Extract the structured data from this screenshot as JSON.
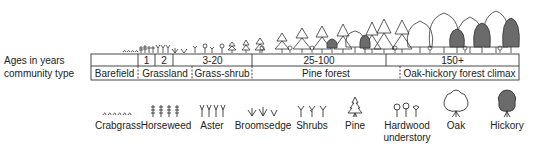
{
  "diagram": {
    "row_labels": {
      "ages": "Ages in years",
      "community": "community type"
    },
    "ages": [
      {
        "label": "",
        "x0": 91,
        "x1": 138
      },
      {
        "label": "1",
        "x0": 138,
        "x1": 155
      },
      {
        "label": "2",
        "x0": 155,
        "x1": 173
      },
      {
        "label": "3-20",
        "x0": 173,
        "x1": 252
      },
      {
        "label": "25-100",
        "x0": 252,
        "x1": 386
      },
      {
        "label": "150+",
        "x0": 386,
        "x1": 519
      }
    ],
    "communities": [
      {
        "label": "Barefield",
        "x0": 91,
        "x1": 138
      },
      {
        "label": "Grassland",
        "x0": 138,
        "x1": 192
      },
      {
        "label": "Grass-shrub",
        "x0": 192,
        "x1": 252
      },
      {
        "label": "Pine forest",
        "x0": 252,
        "x1": 400
      },
      {
        "label": "Oak-hickory forest climax",
        "x0": 400,
        "x1": 519
      }
    ],
    "colors": {
      "line": "#333333",
      "hickory_fill": "#6b6b6b",
      "text": "#222222"
    }
  },
  "legend": [
    {
      "icon": "crabgrass-icon",
      "label": "Crabgrass",
      "cx": 118
    },
    {
      "icon": "horseweed-icon",
      "label": "Horseweed",
      "cx": 166
    },
    {
      "icon": "aster-icon",
      "label": "Aster",
      "cx": 212
    },
    {
      "icon": "broomsedge-icon",
      "label": "Broomsedge",
      "cx": 262
    },
    {
      "icon": "shrubs-icon",
      "label": "Shrubs",
      "cx": 311
    },
    {
      "icon": "pine-icon",
      "label": "Pine",
      "cx": 355
    },
    {
      "icon": "hardwood-understory-icon",
      "label": "Hardwood",
      "label2": "understory",
      "cx": 407
    },
    {
      "icon": "oak-icon",
      "label": "Oak",
      "cx": 456
    },
    {
      "icon": "hickory-icon",
      "label": "Hickory",
      "cx": 507
    }
  ]
}
